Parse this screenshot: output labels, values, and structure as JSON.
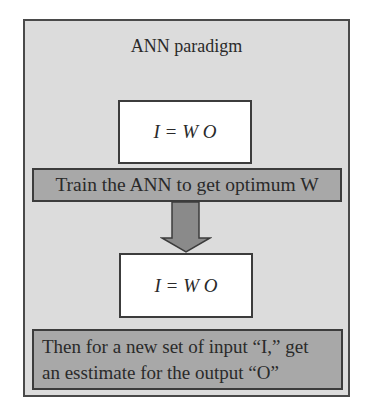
{
  "diagram": {
    "title": "ANN paradigm",
    "equation_top": "I = W O",
    "train_step": "Train the ANN to get optimum W",
    "equation_bottom": "I = W O",
    "predict_step_line1": "Then for a new set of input “I,” get",
    "predict_step_line2": "an esstimate for the output “O”",
    "arrow": "down-arrow-icon",
    "colors": {
      "panel": "#dcdcdc",
      "band": "#a8a8a8",
      "arrow": "#8a8a8a",
      "border": "#3c3c3c"
    }
  }
}
